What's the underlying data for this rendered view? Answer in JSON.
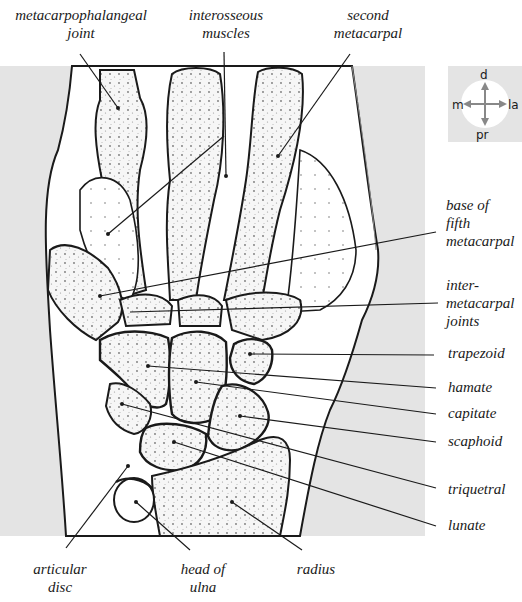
{
  "figure": {
    "background_panel_color": "#e4e4e4",
    "bone_fill_color": "#f4f4f4",
    "outline_color": "#1a1a1a"
  },
  "compass": {
    "top": "d",
    "bottom": "pr",
    "left": "m",
    "right": "la"
  },
  "labels_top": [
    {
      "id": "metacarpophalangeal-joint",
      "lines": [
        "metacarpophalangeal",
        "joint"
      ]
    },
    {
      "id": "interosseous-muscles",
      "lines": [
        "interosseous",
        "muscles"
      ]
    },
    {
      "id": "second-metacarpal",
      "lines": [
        "second",
        "metacarpal"
      ]
    }
  ],
  "labels_right": [
    {
      "id": "base-of-fifth-metacarpal",
      "lines": [
        "base of",
        "fifth",
        "metacarpal"
      ]
    },
    {
      "id": "intermetacarpal-joints",
      "lines": [
        "inter-",
        "metacarpal",
        "joints"
      ]
    },
    {
      "id": "trapezoid",
      "lines": [
        "trapezoid"
      ]
    },
    {
      "id": "hamate",
      "lines": [
        "hamate"
      ]
    },
    {
      "id": "capitate",
      "lines": [
        "capitate"
      ]
    },
    {
      "id": "scaphoid",
      "lines": [
        "scaphoid"
      ]
    },
    {
      "id": "triquetral",
      "lines": [
        "triquetral"
      ]
    },
    {
      "id": "lunate",
      "lines": [
        "lunate"
      ]
    }
  ],
  "labels_bottom": [
    {
      "id": "articular-disc",
      "lines": [
        "articular",
        "disc"
      ]
    },
    {
      "id": "head-of-ulna",
      "lines": [
        "head of",
        "ulna"
      ]
    },
    {
      "id": "radius",
      "lines": [
        "radius"
      ]
    }
  ]
}
